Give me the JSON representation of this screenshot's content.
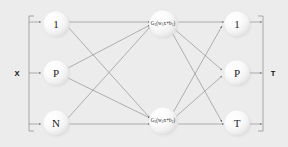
{
  "diagram": {
    "background_color": "#ececed",
    "node_fill_color": "#f6f6f6",
    "edge_color": "#6e6e70",
    "text_color": "#1c1c1c"
  },
  "input_bracket": {
    "label": "X",
    "arrow_count": 3
  },
  "output_bracket": {
    "label": "T",
    "arrow_count": 3
  },
  "layers": [
    {
      "name": "input-layer",
      "nodes": [
        {
          "id": "in-1",
          "label": "1"
        },
        {
          "id": "in-p",
          "label": "P"
        },
        {
          "id": "in-n",
          "label": "N"
        }
      ]
    },
    {
      "name": "hidden-layer",
      "nodes": [
        {
          "id": "hid-1",
          "label": "G1(w1x+b1)",
          "parts": {
            "fn": "G",
            "fn_index": "1",
            "open": "(",
            "weight": "w",
            "weight_index": "1",
            "var": "x",
            "plus": "+",
            "bias": "b",
            "bias_index": "1",
            "close": ")"
          }
        },
        {
          "id": "hid-2",
          "label": "G2(w2x+b2)",
          "parts": {
            "fn": "G",
            "fn_index": "2",
            "open": "(",
            "weight": "w",
            "weight_index": "2",
            "var": "x",
            "plus": "+",
            "bias": "b",
            "bias_index": "2",
            "close": ")"
          }
        }
      ]
    },
    {
      "name": "output-layer",
      "nodes": [
        {
          "id": "out-1",
          "label": "1"
        },
        {
          "id": "out-p",
          "label": "P"
        },
        {
          "id": "out-t",
          "label": "T"
        }
      ]
    }
  ]
}
